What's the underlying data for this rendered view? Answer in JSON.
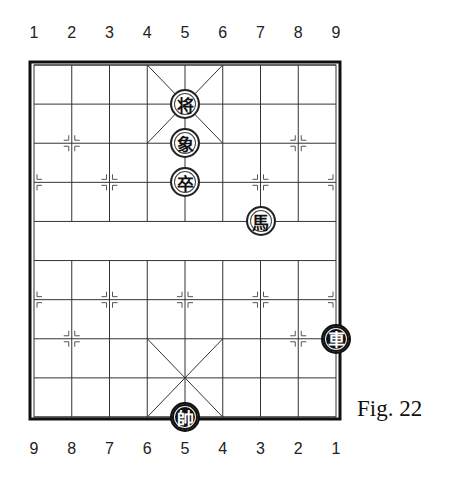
{
  "figure": {
    "caption": "Fig. 22",
    "top_file_labels": [
      "1",
      "2",
      "3",
      "4",
      "5",
      "6",
      "7",
      "8",
      "9"
    ],
    "bottom_file_labels": [
      "9",
      "8",
      "7",
      "6",
      "5",
      "4",
      "3",
      "2",
      "1"
    ]
  },
  "board": {
    "columns": 9,
    "rows": 10,
    "line_color": "#333333",
    "border_color": "#111111"
  },
  "pieces": [
    {
      "char": "将",
      "name": "black-general",
      "side": "black",
      "col": 4,
      "row": 1
    },
    {
      "char": "象",
      "name": "black-elephant",
      "side": "black",
      "col": 4,
      "row": 2
    },
    {
      "char": "卒",
      "name": "black-soldier",
      "side": "black",
      "col": 4,
      "row": 3
    },
    {
      "char": "馬",
      "name": "black-horse",
      "side": "black",
      "col": 6,
      "row": 4
    },
    {
      "char": "車",
      "name": "red-chariot",
      "side": "red",
      "col": 8,
      "row": 7
    },
    {
      "char": "帥",
      "name": "red-general",
      "side": "red",
      "col": 4,
      "row": 9
    }
  ]
}
